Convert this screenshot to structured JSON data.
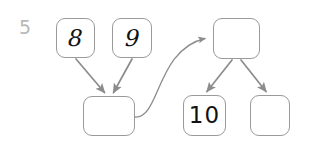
{
  "page": {
    "problem_number": "5",
    "background_color": "#ffffff",
    "node_border_color": "#9a9a9a",
    "edge_color": "#8c8c8c",
    "label_color": "#121212",
    "problem_number_color": "#b9b9b9"
  },
  "diagram": {
    "type": "node-link-tree",
    "nodes": [
      {
        "id": "n8",
        "label": "8",
        "empty": false,
        "x": 56,
        "y": 18,
        "w": 39,
        "h": 40
      },
      {
        "id": "n9",
        "label": "9",
        "empty": false,
        "x": 112,
        "y": 18,
        "w": 40,
        "h": 40
      },
      {
        "id": "nTopR",
        "label": "",
        "empty": true,
        "x": 213,
        "y": 18,
        "w": 47,
        "h": 41
      },
      {
        "id": "nBotL",
        "label": "",
        "empty": true,
        "x": 83,
        "y": 96,
        "w": 52,
        "h": 40
      },
      {
        "id": "n10",
        "label": "10",
        "empty": false,
        "x": 183,
        "y": 95,
        "w": 43,
        "h": 41
      },
      {
        "id": "nBotR",
        "label": "",
        "empty": true,
        "x": 250,
        "y": 95,
        "w": 40,
        "h": 41
      }
    ],
    "edges": [
      {
        "id": "e1",
        "from": "n8",
        "to": "nBotL",
        "kind": "straight",
        "arrowhead": true
      },
      {
        "id": "e2",
        "from": "n9",
        "to": "nBotL",
        "kind": "straight",
        "arrowhead": true
      },
      {
        "id": "e3",
        "from": "nBotL",
        "to": "nTopR",
        "kind": "curved",
        "arrowhead": true
      },
      {
        "id": "e4",
        "from": "nTopR",
        "to": "n10",
        "kind": "straight",
        "arrowhead": true
      },
      {
        "id": "e5",
        "from": "nTopR",
        "to": "nBotR",
        "kind": "straight",
        "arrowhead": true
      }
    ]
  }
}
